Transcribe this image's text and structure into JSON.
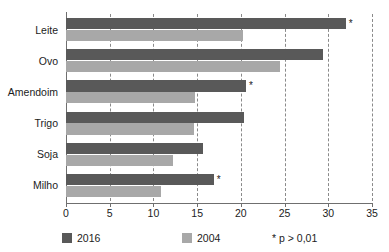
{
  "chart_data": {
    "type": "bar",
    "orientation": "horizontal",
    "title": "",
    "xlabel": "",
    "ylabel": "",
    "xlim": [
      0,
      35
    ],
    "xticks": [
      0,
      5,
      10,
      15,
      20,
      25,
      30,
      35
    ],
    "grid": "vertical-dashed",
    "categories": [
      "Leite",
      "Ovo",
      "Amendoim",
      "Trigo",
      "Soja",
      "Milho"
    ],
    "series": [
      {
        "name": "2016",
        "color": "#595959",
        "values": [
          32.0,
          29.4,
          20.6,
          20.4,
          15.7,
          16.9
        ],
        "significance": [
          "*",
          "",
          "*",
          "",
          "",
          "*"
        ]
      },
      {
        "name": "2004",
        "color": "#a8a8a8",
        "values": [
          20.3,
          24.5,
          14.7,
          14.6,
          12.2,
          10.9
        ],
        "significance": [
          "",
          "",
          "",
          "",
          "",
          ""
        ]
      }
    ],
    "legend": {
      "position": "bottom",
      "entries": [
        {
          "label": "2016",
          "color": "#595959"
        },
        {
          "label": "2004",
          "color": "#a8a8a8"
        }
      ],
      "note": "* p > 0,01"
    }
  }
}
